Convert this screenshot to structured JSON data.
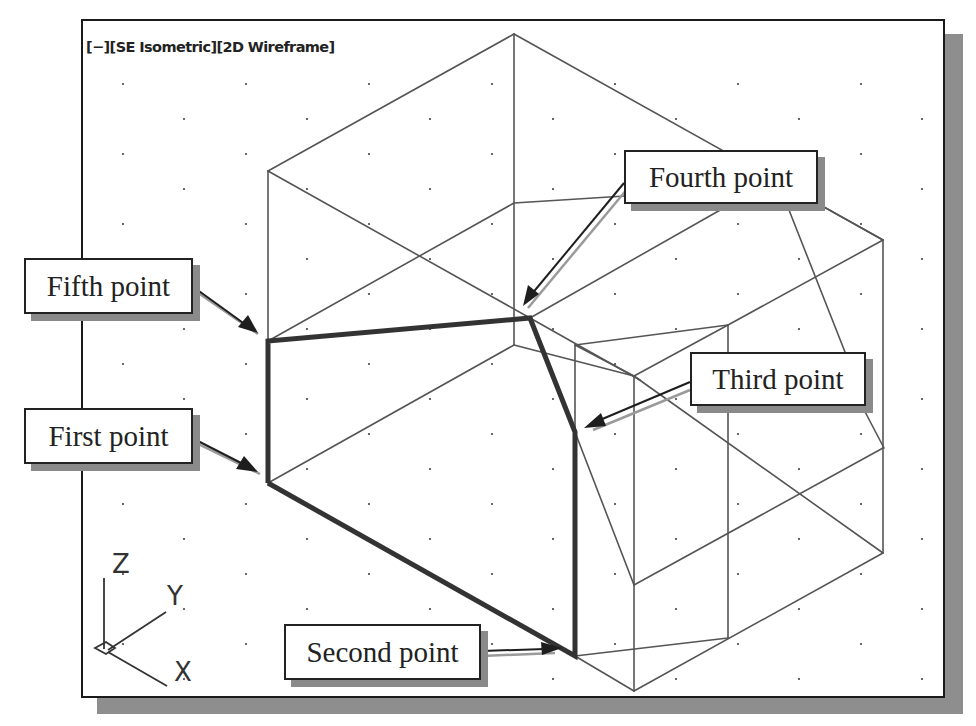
{
  "viewport": {
    "label": "[−][SE Isometric][2D Wireframe]",
    "controls": {
      "viewport_menu": "[−]",
      "view": "SE Isometric",
      "visual_style": "2D Wireframe"
    }
  },
  "callouts": {
    "first": "First point",
    "second": "Second point",
    "third": "Third point",
    "fourth": "Fourth point",
    "fifth": "Fifth point"
  },
  "ucs_icon": {
    "x_label": "X",
    "y_label": "Y",
    "z_label": "Z"
  },
  "colors": {
    "wireframe": "#555555",
    "heavy_polyline": "#333333",
    "arrow": "#1e1e1e",
    "arrow_shadow": "#9a9a9a",
    "frame": "#1a1a1a",
    "shadow": "#8e8e8e"
  },
  "polyline_points": [
    {
      "name": "First point",
      "x": 268,
      "y": 483
    },
    {
      "name": "Second point",
      "x": 575,
      "y": 656
    },
    {
      "name": "Third point",
      "x": 575,
      "y": 432
    },
    {
      "name": "Fourth point",
      "x": 530,
      "y": 318
    },
    {
      "name": "Fifth point",
      "x": 268,
      "y": 341
    }
  ]
}
